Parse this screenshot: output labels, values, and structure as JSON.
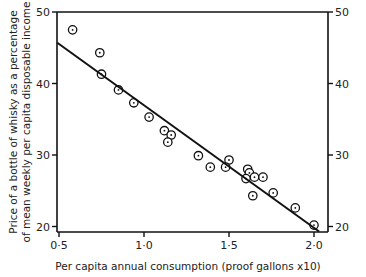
{
  "chart_data": {
    "type": "scatter",
    "title": "",
    "xlabel": "Per capita annual consumption (proof gallons x10)",
    "ylabel_line1": "Price of a bottle of whisky as a percentage",
    "ylabel_line2": "of mean weekly per capita disposable income",
    "xlim": [
      0.5,
      2.05
    ],
    "ylim": [
      19.3,
      50
    ],
    "x_ticks": [
      0.5,
      1.0,
      1.5,
      2.0
    ],
    "x_tick_labels": [
      "0·5",
      "1·0",
      "1·5",
      "2·0"
    ],
    "y_ticks": [
      20,
      30,
      40,
      50
    ],
    "y_tick_labels": [
      "20",
      "30",
      "40",
      "50"
    ],
    "right_y_ticks": [
      20,
      30,
      40,
      50
    ],
    "right_y_tick_labels": [
      "20",
      "30",
      "40",
      "50"
    ],
    "grid": false,
    "legend": null,
    "marker": "circle-with-dot",
    "series": [
      {
        "name": "observations",
        "points": [
          {
            "x": 0.58,
            "y": 47.5
          },
          {
            "x": 0.74,
            "y": 44.3
          },
          {
            "x": 0.75,
            "y": 41.3
          },
          {
            "x": 0.85,
            "y": 39.1
          },
          {
            "x": 0.94,
            "y": 37.3
          },
          {
            "x": 1.03,
            "y": 35.3
          },
          {
            "x": 1.12,
            "y": 33.4
          },
          {
            "x": 1.16,
            "y": 32.8
          },
          {
            "x": 1.14,
            "y": 31.8
          },
          {
            "x": 1.32,
            "y": 29.9
          },
          {
            "x": 1.39,
            "y": 28.3
          },
          {
            "x": 1.5,
            "y": 29.3
          },
          {
            "x": 1.48,
            "y": 28.3
          },
          {
            "x": 1.61,
            "y": 28.0
          },
          {
            "x": 1.62,
            "y": 27.5
          },
          {
            "x": 1.65,
            "y": 26.9
          },
          {
            "x": 1.6,
            "y": 26.7
          },
          {
            "x": 1.7,
            "y": 26.9
          },
          {
            "x": 1.64,
            "y": 24.3
          },
          {
            "x": 1.76,
            "y": 24.7
          },
          {
            "x": 1.89,
            "y": 22.6
          },
          {
            "x": 2.0,
            "y": 20.2
          }
        ]
      }
    ],
    "fit_line": {
      "x1": 0.49,
      "y1": 45.7,
      "x2": 2.03,
      "y2": 19.3
    }
  }
}
